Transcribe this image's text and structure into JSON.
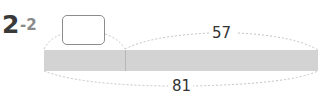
{
  "problem": {
    "number": "2",
    "sub_number": "-2"
  },
  "diagram": {
    "type": "tape-diagram",
    "unknown_part_box": "",
    "known_part_value": "57",
    "total_value": "81",
    "colors": {
      "bar_fill": "#d3d3d3",
      "divider": "#b8b8b8",
      "brace": "#b5b5b5",
      "box_border": "#8c8c8c",
      "text": "#333333"
    }
  }
}
